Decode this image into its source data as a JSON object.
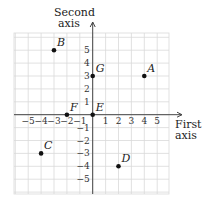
{
  "diagram": {
    "type": "coordinate-plane",
    "x_axis_label": [
      "First",
      "axis"
    ],
    "y_axis_label": [
      "Second",
      "axis"
    ],
    "x_ticks": [
      -5,
      -4,
      -3,
      -2,
      -1,
      1,
      2,
      3,
      4,
      5
    ],
    "y_ticks": [
      5,
      4,
      3,
      2,
      1,
      -1,
      -2,
      -3,
      -4,
      -5
    ],
    "grid_range": [
      -6,
      6
    ],
    "points": [
      {
        "label": "A",
        "x": 4,
        "y": 3
      },
      {
        "label": "B",
        "x": -3,
        "y": 5
      },
      {
        "label": "C",
        "x": -4,
        "y": -3
      },
      {
        "label": "D",
        "x": 2,
        "y": -4
      },
      {
        "label": "E",
        "x": 0,
        "y": 0
      },
      {
        "label": "F",
        "x": -2,
        "y": 0
      },
      {
        "label": "G",
        "x": 0,
        "y": 3
      }
    ]
  },
  "colors": {
    "grid": "#d9d9d9",
    "axis": "#444444",
    "point": "#111111",
    "text": "#222222"
  }
}
